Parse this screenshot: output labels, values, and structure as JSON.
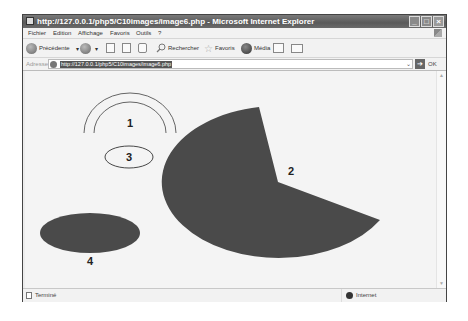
{
  "window": {
    "title": "http://127.0.0.1/php5/C10images/image6.php - Microsoft Internet Explorer",
    "controls": {
      "minimize": "_",
      "maximize": "□",
      "close": "×"
    }
  },
  "menu": {
    "items": [
      {
        "label": "Fichier"
      },
      {
        "label": "Edition"
      },
      {
        "label": "Affichage"
      },
      {
        "label": "Favoris"
      },
      {
        "label": "Outils"
      },
      {
        "label": "?"
      }
    ]
  },
  "toolbar": {
    "back_label": "Précédente",
    "search_label": "Rechercher",
    "favorites_label": "Favoris",
    "media_label": "Média",
    "dropdown_glyph": "▾"
  },
  "address": {
    "label": "Adresse",
    "url": "http://127.0.0.1/php5/C10images/image6.php",
    "dropdown_glyph": "⌄",
    "go_glyph": "➔",
    "go_label": "OK"
  },
  "content": {
    "shapes": [
      {
        "id": "1",
        "type": "double-arc",
        "label": "1",
        "stroke": "#555555"
      },
      {
        "id": "2",
        "type": "filled-pie",
        "label": "2",
        "fill": "#4a4a4a"
      },
      {
        "id": "3",
        "type": "ellipse-outline",
        "label": "3",
        "stroke": "#333333"
      },
      {
        "id": "4",
        "type": "filled-ellipse",
        "label": "4",
        "fill": "#4a4a4a"
      }
    ]
  },
  "statusbar": {
    "left_text": "Terminé",
    "zone_text": "Internet"
  }
}
